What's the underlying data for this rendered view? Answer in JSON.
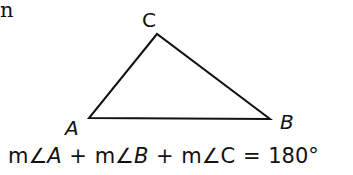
{
  "fragment_text": "n",
  "diagram": {
    "type": "triangle",
    "vertices": {
      "A": {
        "label": "A",
        "x": 89,
        "y": 118
      },
      "B": {
        "label": "B",
        "x": 270,
        "y": 119
      },
      "C": {
        "label": "C",
        "x": 157,
        "y": 34
      }
    }
  },
  "equation": {
    "t1_m": "m",
    "t1_angle": "∠",
    "t1_v": "A",
    "plus1": " + ",
    "t2_m": "m",
    "t2_angle": "∠",
    "t2_v": "B",
    "plus2": " + ",
    "t3_m": "m",
    "t3_angle": "∠",
    "t3_v": "C",
    "equals": " = ",
    "value": "180°"
  }
}
